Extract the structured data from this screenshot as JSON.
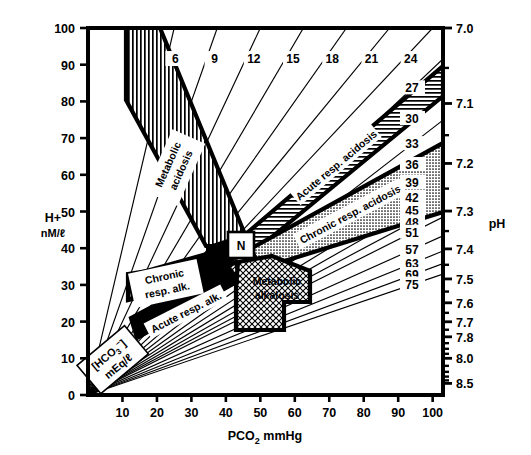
{
  "figure": {
    "kind": "acid-base-nomogram"
  },
  "axes": {
    "x": {
      "label": "PCO",
      "label_sub": "2",
      "label_unit": "mmHg",
      "ticks": [
        10,
        20,
        30,
        40,
        50,
        60,
        70,
        80,
        90,
        100
      ],
      "min": 0,
      "max": 103
    },
    "y_left": {
      "label": "H+",
      "unit": "nM/ℓ",
      "ticks": [
        0,
        10,
        20,
        30,
        40,
        50,
        60,
        70,
        80,
        90,
        100
      ],
      "min": 0,
      "max": 100
    },
    "y_right": {
      "label": "pH",
      "major_ticks": [
        "7.0",
        "7.1",
        "7.2",
        "7.3",
        "7.4",
        "7.5",
        "7.6",
        "7.7",
        "7.8",
        "8.0",
        "8.5"
      ],
      "major_values": [
        7.0,
        7.1,
        7.2,
        7.3,
        7.4,
        7.5,
        7.6,
        7.7,
        7.8,
        8.0,
        8.5
      ],
      "minor_values": [
        7.05,
        7.15,
        7.25,
        7.35,
        7.45,
        7.55,
        7.65,
        7.75,
        7.85,
        7.9,
        7.95,
        8.1,
        8.2,
        8.3,
        8.4
      ]
    }
  },
  "bicarbonate": {
    "label": "[HCO",
    "label_sub": "3",
    "label_sup": "−",
    "label_close": "]",
    "unit": "mEq/ℓ",
    "top_isopleths": [
      6,
      9,
      12,
      15,
      18,
      21,
      24
    ],
    "right_isopleths": [
      27,
      30,
      33,
      36,
      39,
      42,
      45,
      48,
      51,
      57,
      63,
      69,
      75
    ]
  },
  "regions": [
    {
      "id": "metabolic-acidosis",
      "label": "Metabolic acidosis",
      "line1": "Metabolic",
      "line2": "acidosis",
      "fill": "vertical-hatch"
    },
    {
      "id": "acute-resp-acidosis",
      "label": "Acute resp. acidosis",
      "line1": "Acute resp. acidosis",
      "line2": "",
      "fill": "horizontal-hatch"
    },
    {
      "id": "chronic-resp-acidosis",
      "label": "Chronic resp. acidosis",
      "line1": "Chronic resp. acidosis",
      "line2": "",
      "fill": "stipple-gray"
    },
    {
      "id": "chronic-resp-alkalosis",
      "label": "Chronic resp. alk.",
      "line1": "Chronic",
      "line2": "resp. alk.",
      "fill": "diagonal-hatch"
    },
    {
      "id": "acute-resp-alkalosis",
      "label": "Acute resp. alk.",
      "line1": "Acute resp. alk.",
      "line2": "",
      "fill": "diagonal-hatch"
    },
    {
      "id": "metabolic-alkalosis",
      "label": "Metabolic alkalosis",
      "line1": "Metabolic",
      "line2": "alkalosis",
      "fill": "cross-hatch"
    }
  ],
  "normal_point": {
    "label": "N",
    "pco2": 40,
    "h": 40
  },
  "colors": {
    "ink": "#000000",
    "paper": "#ffffff",
    "gray": "#b9b9b9"
  },
  "chart_data": {
    "type": "line",
    "xlabel": "PCO2 mmHg",
    "ylabel": "H+ nM/l",
    "xlim": [
      0,
      103
    ],
    "ylim": [
      0,
      100
    ],
    "grid": false,
    "legend": "none",
    "xticks": [
      10,
      20,
      30,
      40,
      50,
      60,
      70,
      80,
      90,
      100
    ],
    "yticks": [
      0,
      10,
      20,
      30,
      40,
      50,
      60,
      70,
      80,
      90,
      100
    ],
    "secondary_axis": {
      "name": "pH",
      "side": "right",
      "ticks": [
        7.0,
        7.1,
        7.2,
        7.3,
        7.4,
        7.5,
        7.6,
        7.7,
        7.8,
        8.0,
        8.5
      ]
    },
    "series": [
      {
        "name": "HCO3 6",
        "value": 6,
        "relation": "H = 24 * PCO2 / HCO3"
      },
      {
        "name": "HCO3 9",
        "value": 9,
        "relation": "H = 24 * PCO2 / HCO3"
      },
      {
        "name": "HCO3 12",
        "value": 12,
        "relation": "H = 24 * PCO2 / HCO3"
      },
      {
        "name": "HCO3 15",
        "value": 15,
        "relation": "H = 24 * PCO2 / HCO3"
      },
      {
        "name": "HCO3 18",
        "value": 18,
        "relation": "H = 24 * PCO2 / HCO3"
      },
      {
        "name": "HCO3 21",
        "value": 21,
        "relation": "H = 24 * PCO2 / HCO3"
      },
      {
        "name": "HCO3 24",
        "value": 24,
        "relation": "H = 24 * PCO2 / HCO3"
      },
      {
        "name": "HCO3 27",
        "value": 27,
        "relation": "H = 24 * PCO2 / HCO3"
      },
      {
        "name": "HCO3 30",
        "value": 30,
        "relation": "H = 24 * PCO2 / HCO3"
      },
      {
        "name": "HCO3 33",
        "value": 33,
        "relation": "H = 24 * PCO2 / HCO3"
      },
      {
        "name": "HCO3 36",
        "value": 36,
        "relation": "H = 24 * PCO2 / HCO3"
      },
      {
        "name": "HCO3 39",
        "value": 39,
        "relation": "H = 24 * PCO2 / HCO3"
      },
      {
        "name": "HCO3 42",
        "value": 42,
        "relation": "H = 24 * PCO2 / HCO3"
      },
      {
        "name": "HCO3 45",
        "value": 45,
        "relation": "H = 24 * PCO2 / HCO3"
      },
      {
        "name": "HCO3 48",
        "value": 48,
        "relation": "H = 24 * PCO2 / HCO3"
      },
      {
        "name": "HCO3 51",
        "value": 51,
        "relation": "H = 24 * PCO2 / HCO3"
      },
      {
        "name": "HCO3 57",
        "value": 57,
        "relation": "H = 24 * PCO2 / HCO3"
      },
      {
        "name": "HCO3 63",
        "value": 63,
        "relation": "H = 24 * PCO2 / HCO3"
      },
      {
        "name": "HCO3 69",
        "value": 69,
        "relation": "H = 24 * PCO2 / HCO3"
      },
      {
        "name": "HCO3 75",
        "value": 75,
        "relation": "H = 24 * PCO2 / HCO3"
      }
    ],
    "annotations": [
      {
        "text": "Metabolic acidosis",
        "at": [
          22,
          62
        ]
      },
      {
        "text": "Acute resp. acidosis",
        "at": [
          68,
          62
        ]
      },
      {
        "text": "Chronic resp. acidosis",
        "at": [
          70,
          46
        ]
      },
      {
        "text": "Chronic resp. alk.",
        "at": [
          18,
          34
        ]
      },
      {
        "text": "Acute resp. alk.",
        "at": [
          26,
          27
        ]
      },
      {
        "text": "Metabolic alkalosis",
        "at": [
          50,
          32
        ]
      },
      {
        "text": "N",
        "at": [
          40,
          40
        ]
      }
    ]
  }
}
